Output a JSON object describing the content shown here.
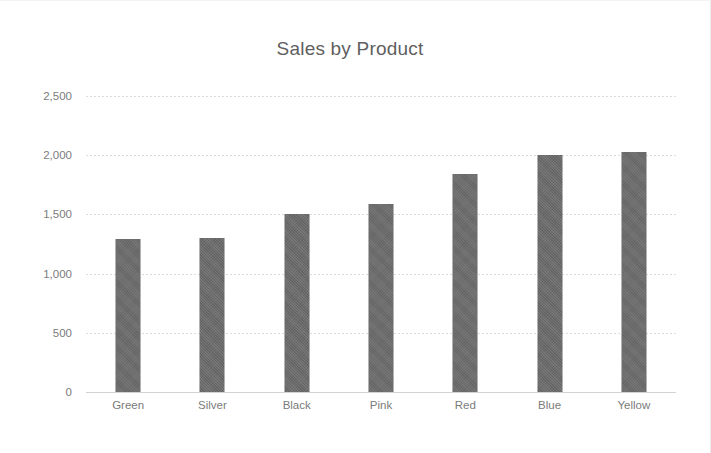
{
  "chart_data": {
    "type": "bar",
    "title": "Sales by Product",
    "xlabel": "",
    "ylabel": "",
    "categories": [
      "Green",
      "Silver",
      "Black",
      "Pink",
      "Red",
      "Blue",
      "Yellow"
    ],
    "values": [
      1295,
      1300,
      1500,
      1590,
      1845,
      2000,
      2030
    ],
    "series": [
      {
        "name": "Sales",
        "values": [
          1295,
          1300,
          1500,
          1590,
          1845,
          2000,
          2030
        ]
      }
    ],
    "ylim": [
      0,
      2500
    ],
    "yticks": [
      0,
      500,
      1000,
      1500,
      2000,
      2500
    ],
    "ytick_labels": [
      "0",
      "500",
      "1,000",
      "1,500",
      "2,000",
      "2,500"
    ],
    "grid": true,
    "legend": false,
    "legend_position": "none",
    "bar_color": "#696969",
    "grid_color": "#dcdcdc",
    "axis_color": "#d2d2d2",
    "title_color": "#5f5f5f",
    "tick_label_color": "#7c7c7c"
  }
}
